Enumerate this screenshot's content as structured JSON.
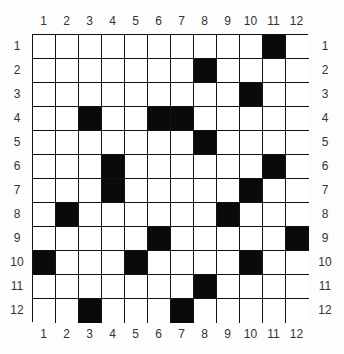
{
  "puzzle": {
    "rows": 12,
    "cols": 12,
    "column_labels": [
      "1",
      "2",
      "3",
      "4",
      "5",
      "6",
      "7",
      "8",
      "9",
      "10",
      "11",
      "12"
    ],
    "row_labels": [
      "1",
      "2",
      "3",
      "4",
      "5",
      "6",
      "7",
      "8",
      "9",
      "10",
      "11",
      "12"
    ],
    "black_cells": [
      [
        1,
        11
      ],
      [
        2,
        8
      ],
      [
        3,
        10
      ],
      [
        4,
        3
      ],
      [
        4,
        6
      ],
      [
        4,
        7
      ],
      [
        5,
        8
      ],
      [
        6,
        4
      ],
      [
        6,
        11
      ],
      [
        7,
        4
      ],
      [
        7,
        10
      ],
      [
        8,
        2
      ],
      [
        8,
        9
      ],
      [
        9,
        6
      ],
      [
        9,
        12
      ],
      [
        10,
        1
      ],
      [
        10,
        5
      ],
      [
        10,
        10
      ],
      [
        11,
        8
      ],
      [
        12,
        3
      ],
      [
        12,
        7
      ]
    ],
    "colors": {
      "black": "#0a0a0a",
      "white": "#ffffff",
      "line": "#111111"
    }
  }
}
